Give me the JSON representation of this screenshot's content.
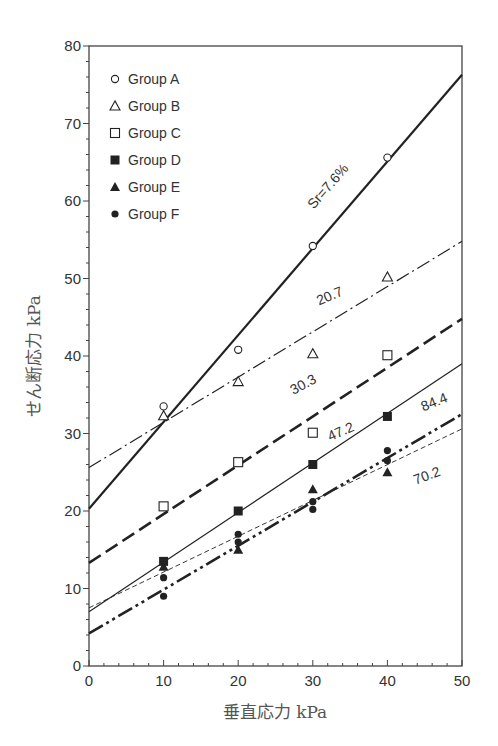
{
  "chart_data": {
    "type": "scatter",
    "title": "",
    "xlabel": "垂直応力 kPa",
    "ylabel": "せん断応力 kPa",
    "xlim": [
      0,
      50
    ],
    "ylim": [
      0,
      80
    ],
    "x_ticks": [
      0,
      10,
      20,
      30,
      40,
      50
    ],
    "y_ticks": [
      0,
      10,
      20,
      30,
      40,
      50,
      60,
      70,
      80
    ],
    "grid": false,
    "legend_position": "upper-left",
    "series": [
      {
        "name": "Group A",
        "marker": "open-circle",
        "points": [
          [
            10,
            33.5
          ],
          [
            20,
            40.8
          ],
          [
            30,
            54.2
          ],
          [
            40,
            65.6
          ]
        ],
        "fit_line": {
          "label": "Sr=7.6%",
          "style": "solid-thick",
          "intercept": 20.3,
          "y_at_50": 76.3
        }
      },
      {
        "name": "Group B",
        "marker": "open-triangle",
        "points": [
          [
            10,
            32.3
          ],
          [
            20,
            36.7
          ],
          [
            30,
            40.3
          ],
          [
            40,
            50.2
          ]
        ],
        "fit_line": {
          "label": "20.7",
          "style": "dash-dot",
          "intercept": 25.6,
          "y_at_50": 54.8
        }
      },
      {
        "name": "Group C",
        "marker": "open-square",
        "points": [
          [
            10,
            20.6
          ],
          [
            20,
            26.3
          ],
          [
            30,
            30.1
          ],
          [
            40,
            40.1
          ]
        ],
        "fit_line": {
          "label": "30.3",
          "style": "long-dash-thick",
          "intercept": 13.3,
          "y_at_50": 44.8
        }
      },
      {
        "name": "Group D",
        "marker": "filled-square",
        "points": [
          [
            10,
            13.5
          ],
          [
            20,
            20.0
          ],
          [
            30,
            26.0
          ],
          [
            40,
            32.2
          ]
        ],
        "fit_line": {
          "label": "47.2",
          "style": "solid-thin",
          "intercept": 7.0,
          "y_at_50": 39.0
        }
      },
      {
        "name": "Group E",
        "marker": "filled-triangle",
        "points": [
          [
            10,
            12.8
          ],
          [
            20,
            15.0
          ],
          [
            30,
            22.8
          ],
          [
            40,
            25.0
          ]
        ],
        "fit_line": {
          "label": "84.4",
          "style": "dash-dot-dot-thick",
          "intercept": 4.2,
          "y_at_50": 32.5
        }
      },
      {
        "name": "Group F",
        "marker": "filled-circle",
        "points": [
          [
            10,
            11.4
          ],
          [
            10,
            9.0
          ],
          [
            20,
            17.0
          ],
          [
            20,
            16.0
          ],
          [
            30,
            21.2
          ],
          [
            30,
            20.2
          ],
          [
            40,
            27.8
          ],
          [
            40,
            26.5
          ]
        ],
        "fit_line": {
          "label": "70.2",
          "style": "dashed-thin",
          "intercept": 7.5,
          "y_at_50": 30.6
        }
      }
    ]
  }
}
